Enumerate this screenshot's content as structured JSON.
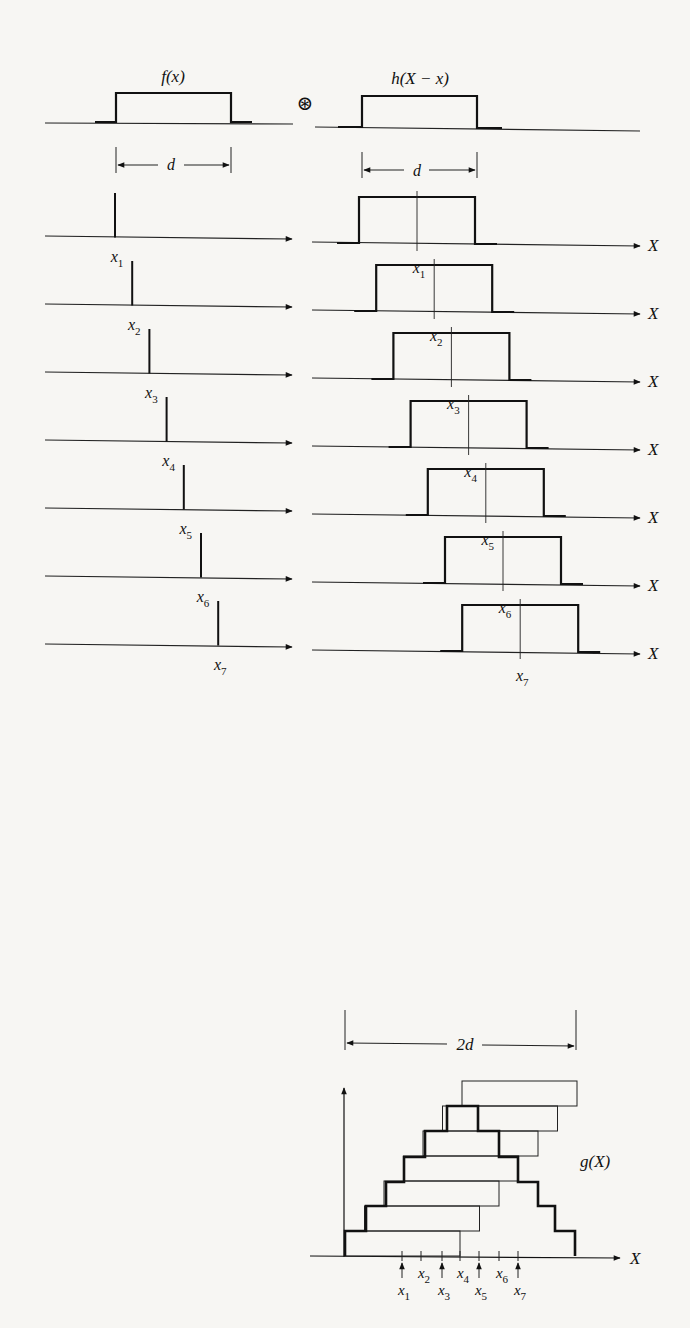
{
  "header": {
    "f_label": "f(x)",
    "h_label": "h(X − x)",
    "convolution_symbol": "⊛",
    "width_label_left": "d",
    "width_label_right": "d"
  },
  "rows": [
    {
      "spike_label": "x",
      "sub": "1",
      "box_label": "x",
      "box_sub": "1",
      "axis_label": "X"
    },
    {
      "spike_label": "x",
      "sub": "2",
      "box_label": "x",
      "box_sub": "2",
      "axis_label": "X"
    },
    {
      "spike_label": "x",
      "sub": "3",
      "box_label": "x",
      "box_sub": "3",
      "axis_label": "X"
    },
    {
      "spike_label": "x",
      "sub": "4",
      "box_label": "x",
      "box_sub": "4",
      "axis_label": "X"
    },
    {
      "spike_label": "x",
      "sub": "5",
      "box_label": "x",
      "box_sub": "5",
      "axis_label": "X"
    },
    {
      "spike_label": "x",
      "sub": "6",
      "box_label": "x",
      "box_sub": "6",
      "axis_label": "X"
    },
    {
      "spike_label": "x",
      "sub": "7",
      "box_label": "x",
      "box_sub": "7",
      "axis_label": "X"
    }
  ],
  "result": {
    "span_label": "2d",
    "g_label": "g(X)",
    "axis_label": "X",
    "tick_labels": [
      {
        "t": "x",
        "s": "1"
      },
      {
        "t": "x",
        "s": "2"
      },
      {
        "t": "x",
        "s": "3"
      },
      {
        "t": "x",
        "s": "4"
      },
      {
        "t": "x",
        "s": "5"
      },
      {
        "t": "x",
        "s": "6"
      },
      {
        "t": "x",
        "s": "7"
      }
    ]
  }
}
